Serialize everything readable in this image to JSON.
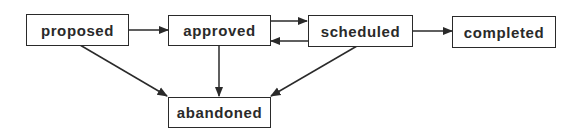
{
  "diagram": {
    "type": "state-transition",
    "nodes": [
      {
        "id": "proposed",
        "label": "proposed"
      },
      {
        "id": "approved",
        "label": "approved"
      },
      {
        "id": "scheduled",
        "label": "scheduled"
      },
      {
        "id": "completed",
        "label": "completed"
      },
      {
        "id": "abandoned",
        "label": "abandoned"
      }
    ],
    "edges": [
      {
        "from": "proposed",
        "to": "approved"
      },
      {
        "from": "approved",
        "to": "scheduled"
      },
      {
        "from": "scheduled",
        "to": "approved"
      },
      {
        "from": "scheduled",
        "to": "completed"
      },
      {
        "from": "proposed",
        "to": "abandoned"
      },
      {
        "from": "approved",
        "to": "abandoned"
      },
      {
        "from": "scheduled",
        "to": "abandoned"
      }
    ],
    "colors": {
      "line": "#2a2a2a",
      "background": "#ffffff"
    }
  }
}
